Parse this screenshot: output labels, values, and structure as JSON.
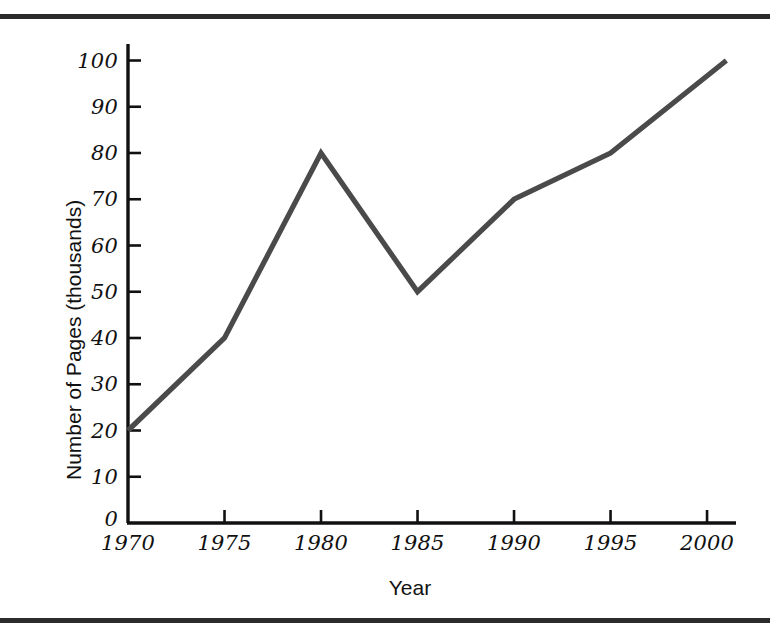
{
  "figure": {
    "background_color": "#ffffff",
    "rule_color": "#2b2b2b",
    "line_color": "#4a4a4a",
    "axis_color": "#111111",
    "text_color": "#111111"
  },
  "chart_data": {
    "type": "line",
    "title": "",
    "xlabel": "Year",
    "ylabel": "Number of Pages (thousands)",
    "x": [
      1970,
      1975,
      1980,
      1985,
      1990,
      1995,
      2001
    ],
    "values": [
      20,
      40,
      80,
      50,
      70,
      80,
      100
    ],
    "series": [
      {
        "name": "Number of Pages",
        "x": [
          1970,
          1975,
          1980,
          1985,
          1990,
          1995,
          2001
        ],
        "values": [
          20,
          40,
          80,
          50,
          70,
          80,
          100
        ]
      }
    ],
    "xlim": [
      1970,
      2001.5
    ],
    "ylim": [
      0,
      104
    ],
    "xticks": [
      1970,
      1975,
      1980,
      1985,
      1990,
      1995,
      2000
    ],
    "xtick_labels": [
      "1970",
      "1975",
      "1980",
      "1985",
      "1990",
      "1995",
      "2000"
    ],
    "yticks": [
      0,
      10,
      20,
      30,
      40,
      50,
      60,
      70,
      80,
      90,
      100
    ],
    "ytick_labels": [
      "0",
      "10",
      "20",
      "30",
      "40",
      "50",
      "60",
      "70",
      "80",
      "90",
      "100"
    ],
    "grid": false,
    "legend": false,
    "legend_position": "none",
    "tick_direction": "in",
    "annotations": []
  }
}
